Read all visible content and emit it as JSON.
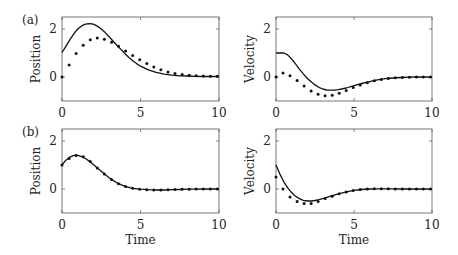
{
  "figure": {
    "panel_labels": [
      "(a)",
      "(b)"
    ],
    "xlabel": "Time"
  },
  "chart_data": [
    {
      "type": "line",
      "panel": "(a)",
      "title": "",
      "xlabel": "",
      "ylabel": "Position",
      "xlim": [
        0,
        10
      ],
      "ylim": [
        -1,
        2.5
      ],
      "xticks": [
        0,
        5,
        10
      ],
      "yticks": [
        0,
        2
      ],
      "grid": false,
      "series": [
        {
          "name": "solid",
          "style": "line",
          "x": [
            0,
            0.25,
            0.5,
            0.75,
            1,
            1.25,
            1.5,
            1.75,
            2,
            2.25,
            2.5,
            2.75,
            3,
            3.25,
            3.5,
            3.75,
            4,
            4.25,
            4.5,
            4.75,
            5,
            5.5,
            6,
            6.5,
            7,
            7.5,
            8,
            8.5,
            9,
            9.5,
            10
          ],
          "y": [
            1.02,
            1.28,
            1.55,
            1.8,
            2.0,
            2.13,
            2.2,
            2.22,
            2.2,
            2.12,
            2.0,
            1.85,
            1.68,
            1.5,
            1.32,
            1.15,
            0.98,
            0.82,
            0.68,
            0.56,
            0.45,
            0.3,
            0.19,
            0.12,
            0.08,
            0.05,
            0.04,
            0.03,
            0.02,
            0.02,
            0.02
          ]
        },
        {
          "name": "dots",
          "style": "markers",
          "x": [
            0,
            0.45,
            0.9,
            1.35,
            1.8,
            2.25,
            2.7,
            3.15,
            3.6,
            4.05,
            4.5,
            4.95,
            5.4,
            5.85,
            6.3,
            6.75,
            7.2,
            7.65,
            8.1,
            8.55,
            9.0,
            9.45,
            9.9
          ],
          "y": [
            0.0,
            0.5,
            0.98,
            1.32,
            1.55,
            1.62,
            1.57,
            1.45,
            1.28,
            1.08,
            0.9,
            0.72,
            0.56,
            0.42,
            0.3,
            0.21,
            0.14,
            0.1,
            0.07,
            0.05,
            0.04,
            0.03,
            0.03
          ]
        }
      ]
    },
    {
      "type": "line",
      "panel": "(a)",
      "title": "",
      "xlabel": "",
      "ylabel": "Velocity",
      "xlim": [
        0,
        10
      ],
      "ylim": [
        -1,
        2.5
      ],
      "xticks": [
        0,
        5,
        10
      ],
      "yticks": [
        0,
        2
      ],
      "grid": false,
      "series": [
        {
          "name": "solid",
          "style": "line",
          "x": [
            0,
            0.25,
            0.5,
            0.75,
            1,
            1.25,
            1.5,
            1.75,
            2,
            2.25,
            2.5,
            2.75,
            3,
            3.25,
            3.5,
            3.75,
            4,
            4.5,
            5,
            5.5,
            6,
            6.5,
            7,
            7.5,
            8,
            8.5,
            9,
            9.5,
            10
          ],
          "y": [
            1.0,
            1.0,
            1.0,
            0.92,
            0.75,
            0.55,
            0.33,
            0.13,
            -0.05,
            -0.2,
            -0.33,
            -0.43,
            -0.5,
            -0.54,
            -0.55,
            -0.55,
            -0.53,
            -0.46,
            -0.36,
            -0.27,
            -0.19,
            -0.12,
            -0.07,
            -0.04,
            -0.02,
            -0.01,
            0.0,
            0.0,
            0.0
          ]
        },
        {
          "name": "dots",
          "style": "markers",
          "x": [
            0,
            0.45,
            0.9,
            1.35,
            1.8,
            2.25,
            2.7,
            3.15,
            3.6,
            4.05,
            4.5,
            4.95,
            5.4,
            5.85,
            6.3,
            6.75,
            7.2,
            7.65,
            8.1,
            8.55,
            9.0,
            9.45,
            9.9
          ],
          "y": [
            0.0,
            0.17,
            0.05,
            -0.15,
            -0.38,
            -0.58,
            -0.72,
            -0.78,
            -0.76,
            -0.68,
            -0.56,
            -0.44,
            -0.33,
            -0.24,
            -0.16,
            -0.1,
            -0.06,
            -0.03,
            -0.02,
            -0.01,
            0.0,
            0.0,
            0.0
          ]
        }
      ]
    },
    {
      "type": "line",
      "panel": "(b)",
      "title": "",
      "xlabel": "Time",
      "ylabel": "Position",
      "xlim": [
        0,
        10
      ],
      "ylim": [
        -1,
        2.5
      ],
      "xticks": [
        0,
        5,
        10
      ],
      "yticks": [
        0,
        2
      ],
      "grid": false,
      "series": [
        {
          "name": "solid",
          "style": "line",
          "x": [
            0,
            0.25,
            0.5,
            0.75,
            1,
            1.25,
            1.5,
            1.75,
            2,
            2.25,
            2.5,
            2.75,
            3,
            3.25,
            3.5,
            3.75,
            4,
            4.5,
            5,
            5.5,
            6,
            6.5,
            7,
            7.5,
            8,
            8.5,
            9,
            9.5,
            10
          ],
          "y": [
            1.0,
            1.2,
            1.33,
            1.4,
            1.4,
            1.35,
            1.27,
            1.15,
            1.02,
            0.88,
            0.74,
            0.6,
            0.47,
            0.36,
            0.26,
            0.18,
            0.11,
            0.03,
            -0.01,
            -0.03,
            -0.04,
            -0.04,
            -0.03,
            -0.02,
            -0.01,
            -0.01,
            0.0,
            0.0,
            0.0
          ]
        },
        {
          "name": "dots",
          "style": "markers",
          "x": [
            0,
            0.45,
            0.9,
            1.35,
            1.8,
            2.25,
            2.7,
            3.15,
            3.6,
            4.05,
            4.5,
            4.95,
            5.4,
            5.85,
            6.3,
            6.75,
            7.2,
            7.65,
            8.1,
            8.55,
            9.0,
            9.45,
            9.9
          ],
          "y": [
            1.0,
            1.27,
            1.4,
            1.34,
            1.14,
            0.88,
            0.62,
            0.4,
            0.22,
            0.1,
            0.03,
            -0.01,
            -0.03,
            -0.04,
            -0.04,
            -0.03,
            -0.02,
            -0.01,
            -0.01,
            0.0,
            0.0,
            0.0,
            0.0
          ]
        }
      ]
    },
    {
      "type": "line",
      "panel": "(b)",
      "title": "",
      "xlabel": "Time",
      "ylabel": "Velocity",
      "xlim": [
        0,
        10
      ],
      "ylim": [
        -1,
        2.5
      ],
      "xticks": [
        0,
        5,
        10
      ],
      "yticks": [
        0,
        2
      ],
      "grid": false,
      "series": [
        {
          "name": "solid",
          "style": "line",
          "x": [
            0,
            0.25,
            0.5,
            0.75,
            1,
            1.25,
            1.5,
            1.75,
            2,
            2.25,
            2.5,
            2.75,
            3,
            3.5,
            4,
            4.5,
            5,
            5.5,
            6,
            6.5,
            7,
            7.5,
            8,
            8.5,
            9,
            9.5,
            10
          ],
          "y": [
            1.0,
            0.62,
            0.3,
            0.05,
            -0.15,
            -0.3,
            -0.4,
            -0.47,
            -0.5,
            -0.5,
            -0.48,
            -0.44,
            -0.4,
            -0.3,
            -0.2,
            -0.12,
            -0.06,
            -0.02,
            0.0,
            0.01,
            0.01,
            0.01,
            0.0,
            0.0,
            0.0,
            0.0,
            0.0
          ]
        },
        {
          "name": "dots",
          "style": "markers",
          "x": [
            0,
            0.45,
            0.9,
            1.35,
            1.8,
            2.25,
            2.7,
            3.15,
            3.6,
            4.05,
            4.5,
            4.95,
            5.4,
            5.85,
            6.3,
            6.75,
            7.2,
            7.65,
            8.1,
            8.55,
            9.0,
            9.45,
            9.9
          ],
          "y": [
            0.5,
            0.0,
            -0.33,
            -0.52,
            -0.6,
            -0.6,
            -0.52,
            -0.4,
            -0.3,
            -0.2,
            -0.12,
            -0.06,
            -0.02,
            0.0,
            0.01,
            0.01,
            0.01,
            0.0,
            0.0,
            0.0,
            0.0,
            0.0,
            0.0
          ]
        }
      ]
    }
  ]
}
